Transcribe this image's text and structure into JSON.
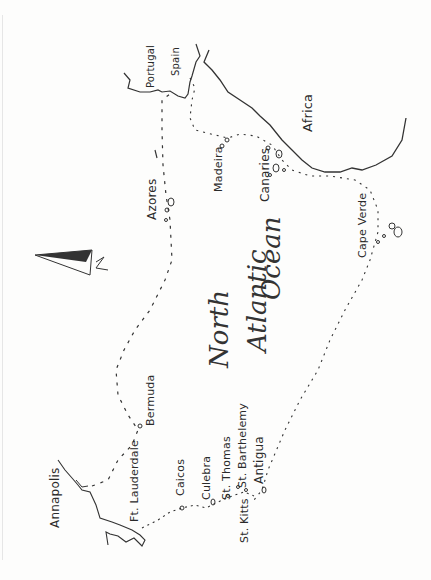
{
  "map": {
    "title": "North Atlantic Ocean",
    "ocean_label": [
      "North",
      "Atlantic",
      "Ocean"
    ],
    "compass": {
      "label": "N",
      "icon": "north-arrow-icon"
    },
    "landmasses": [
      "Africa",
      "Portugal",
      "Spain"
    ],
    "places": {
      "portugal": "Portugal",
      "spain": "Spain",
      "africa": "Africa",
      "azores": "Azores",
      "madeira": "Madeira",
      "canaries": "Canaries",
      "cape_verde": "Cape Verde",
      "bermuda": "Bermuda",
      "annapolis": "Annapolis",
      "ft_lauderdale": "Ft. Lauderdale",
      "caicos": "Caicos",
      "culebra": "Culebra",
      "st_thomas": "St. Thomas",
      "st_barthelemy": "St. Barthelemy",
      "antigua": "Antigua",
      "st_kitts": "St. Kitts"
    },
    "colors": {
      "ink": "#222222",
      "paper": "#fdfdfc"
    }
  }
}
